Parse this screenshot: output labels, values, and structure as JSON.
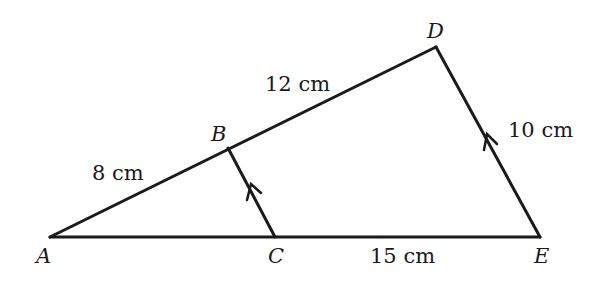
{
  "diagram": {
    "type": "geometry-similar-triangles",
    "points": {
      "A": {
        "label": "A",
        "x": 50,
        "y": 237
      },
      "B": {
        "label": "B",
        "x": 228,
        "y": 148
      },
      "C": {
        "label": "C",
        "x": 275,
        "y": 237
      },
      "D": {
        "label": "D",
        "x": 436,
        "y": 47
      },
      "E": {
        "label": "E",
        "x": 540,
        "y": 237
      }
    },
    "segments": [
      {
        "from": "A",
        "to": "D"
      },
      {
        "from": "A",
        "to": "E"
      },
      {
        "from": "D",
        "to": "E"
      },
      {
        "from": "B",
        "to": "C"
      }
    ],
    "parallel_marks": [
      "BC",
      "DE"
    ],
    "measurements": {
      "AB": "8 cm",
      "BD": "12 cm",
      "DE": "10 cm",
      "CE": "15 cm"
    },
    "stroke_color": "#1a1a1a"
  }
}
